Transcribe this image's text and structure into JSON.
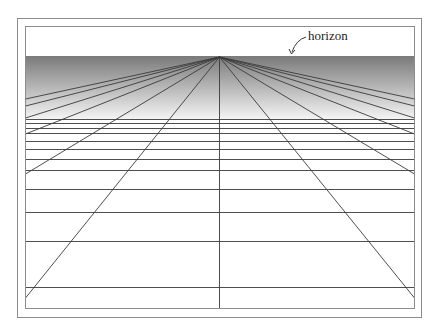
{
  "figure": {
    "annotation_label": "horizon",
    "colors": {
      "background": "#ffffff",
      "frame": "#8c8c8c",
      "lines": "#3a3a3a",
      "gradient_top": "#7a7a7a",
      "gradient_bottom": "#f4f4f4"
    },
    "outer_frame": {
      "x": 17,
      "y": 18,
      "w": 404,
      "h": 299
    },
    "inner_frame": {
      "x": 25,
      "y": 26,
      "w": 389,
      "h": 282
    },
    "horizon_y": 56,
    "gradient_end_y": 119,
    "vanishing_point": {
      "x": 219,
      "y": 57
    },
    "ray_endpoints": [
      {
        "x": 25,
        "y": 99
      },
      {
        "x": 25,
        "y": 106
      },
      {
        "x": 25,
        "y": 118
      },
      {
        "x": 25,
        "y": 134
      },
      {
        "x": 25,
        "y": 174
      },
      {
        "x": 25,
        "y": 298
      },
      {
        "x": 219,
        "y": 308
      },
      {
        "x": 414,
        "y": 298
      },
      {
        "x": 414,
        "y": 174
      },
      {
        "x": 414,
        "y": 134
      },
      {
        "x": 414,
        "y": 118
      },
      {
        "x": 414,
        "y": 106
      },
      {
        "x": 414,
        "y": 99
      }
    ],
    "horizontal_lines_y": [
      119,
      123,
      128,
      133,
      141,
      149,
      159,
      170,
      189,
      212,
      241,
      287
    ]
  }
}
